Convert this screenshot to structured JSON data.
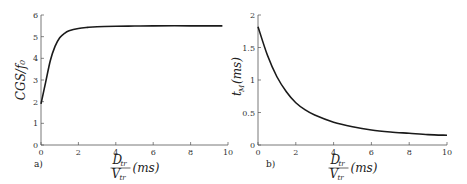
{
  "chart_data": [
    {
      "type": "line",
      "panel_label": "a)",
      "title": "",
      "xlabel": "D_tr / V_tr (ms)",
      "ylabel": "CGS/f0",
      "xlim": [
        0,
        10
      ],
      "ylim": [
        0,
        6
      ],
      "xticks": [
        "0",
        "2",
        "4",
        "6",
        "8",
        "10"
      ],
      "yticks": [
        "0",
        "1",
        "2",
        "3",
        "4",
        "5",
        "6"
      ],
      "grid": false,
      "series": [
        {
          "name": "CGS/f0",
          "x": [
            0,
            0.25,
            0.5,
            0.75,
            1,
            1.25,
            1.5,
            2,
            2.5,
            3,
            4,
            5,
            6,
            8,
            9.7
          ],
          "y": [
            1.9,
            2.9,
            3.9,
            4.55,
            4.95,
            5.15,
            5.27,
            5.38,
            5.43,
            5.46,
            5.48,
            5.49,
            5.5,
            5.5,
            5.5
          ]
        }
      ]
    },
    {
      "type": "line",
      "panel_label": "b)",
      "title": "",
      "xlabel": "D_tr / V_tr (ms)",
      "ylabel": "t_M (ms)",
      "xlim": [
        0,
        10
      ],
      "ylim": [
        0,
        2
      ],
      "xticks": [
        "0",
        "2",
        "4",
        "6",
        "8",
        "10"
      ],
      "yticks": [
        "0",
        "0.5",
        "1",
        "1.5",
        "2"
      ],
      "grid": false,
      "series": [
        {
          "name": "t_M",
          "x": [
            0,
            0.5,
            1,
            1.5,
            2,
            2.5,
            3,
            4,
            5,
            6,
            7,
            8,
            9,
            10
          ],
          "y": [
            1.82,
            1.38,
            1.05,
            0.82,
            0.65,
            0.54,
            0.46,
            0.35,
            0.28,
            0.23,
            0.2,
            0.18,
            0.16,
            0.15
          ]
        }
      ]
    }
  ],
  "labels": {
    "a_panel": "a)",
    "b_panel": "b)",
    "a_ylabel": "CGS/f₀",
    "b_ylabel": "t",
    "b_ylabel_sub": "M",
    "b_ylabel_tail": "(ms)",
    "xfrac_num": "D",
    "xfrac_den": "V",
    "xfrac_sub": "tr",
    "xunit": "(ms)"
  }
}
